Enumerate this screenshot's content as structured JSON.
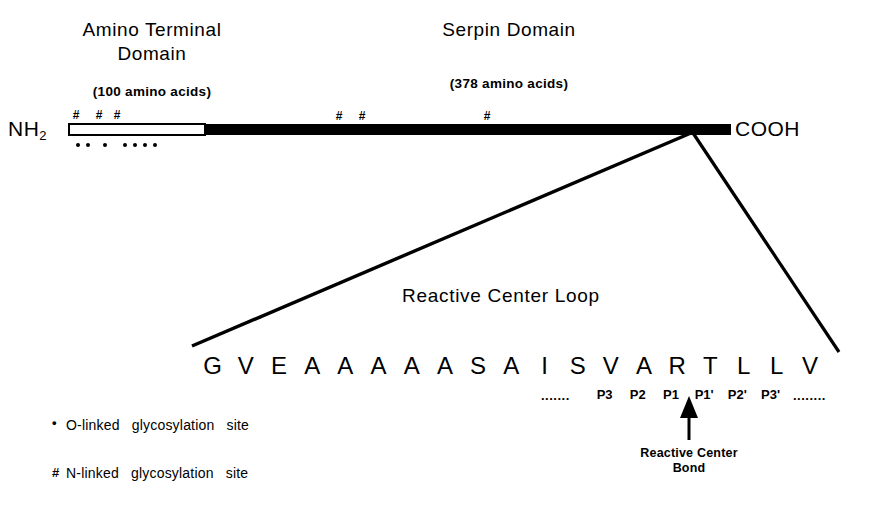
{
  "termini": {
    "n_terminus": "NH2",
    "n_terminus_base": "NH",
    "n_terminus_sub": "2",
    "c_terminus": "COOH"
  },
  "domains": [
    {
      "id": "amino-terminal-domain",
      "title": "Amino  Terminal\nDomain",
      "size_label": "(100  amino acids)",
      "length_aa": 100,
      "fill": "white"
    },
    {
      "id": "serpin-domain",
      "title": "Serpin  Domain",
      "size_label": "(378  amino acids)",
      "length_aa": 378,
      "fill": "black"
    }
  ],
  "glycosylation": {
    "n_linked_symbol": "#",
    "o_linked_symbol": "•",
    "n_linked_positions_px": [
      76,
      99,
      117,
      339,
      362,
      487
    ],
    "o_linked_positions_px": [
      78,
      88,
      104,
      124,
      134,
      144,
      154
    ]
  },
  "loop": {
    "title": "Reactive  Center  Loop",
    "sequence": [
      "G",
      "V",
      "E",
      "A",
      "A",
      "A",
      "A",
      "A",
      "S",
      "A",
      "I",
      "S",
      "V",
      "A",
      "R",
      "T",
      "L",
      "L",
      "V"
    ],
    "left_ellipsis": ".......",
    "right_ellipsis": "........",
    "p_labels": [
      "P3",
      "P2",
      "P1",
      "P1'",
      "P2'",
      "P3'"
    ],
    "p_label_start_index": 13,
    "reactive_center_caption": "Reactive Center\nBond",
    "scissile_bond_between": [
      "P1",
      "P1'"
    ]
  },
  "legend": [
    {
      "symbol": "•",
      "symbol_name": "o-linked-dot",
      "text_part1": "O-linked",
      "text_part2": "glycosylation",
      "text_part3": "site"
    },
    {
      "symbol": "#",
      "symbol_name": "n-linked-hash",
      "text_part1": "N-linked",
      "text_part2": "glycosylation",
      "text_part3": "site"
    }
  ],
  "colors": {
    "ink": "#000000",
    "paper": "#ffffff"
  }
}
